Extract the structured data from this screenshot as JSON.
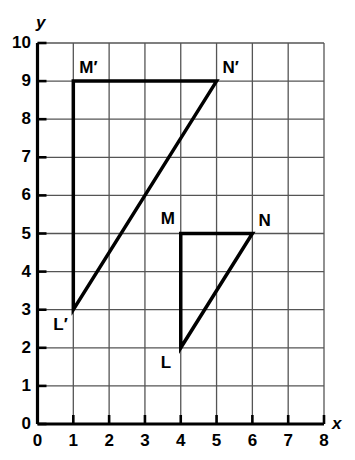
{
  "chart_data": {
    "type": "scatter",
    "title": "",
    "xlabel": "x",
    "ylabel": "y",
    "xlim": [
      0,
      8
    ],
    "ylim": [
      0,
      10
    ],
    "xticks": [
      "0",
      "1",
      "2",
      "3",
      "4",
      "5",
      "6",
      "7",
      "8"
    ],
    "yticks": [
      "0",
      "1",
      "2",
      "3",
      "4",
      "5",
      "6",
      "7",
      "8",
      "9",
      "10"
    ],
    "grid": true,
    "legend": "none",
    "shapes": [
      {
        "name": "triangle-LMN",
        "kind": "triangle",
        "vertices": [
          {
            "label": "L",
            "x": 4,
            "y": 2
          },
          {
            "label": "M",
            "x": 4,
            "y": 5
          },
          {
            "label": "N",
            "x": 6,
            "y": 5
          }
        ],
        "stroke": "#000000",
        "stroke_width": 3.5,
        "fill": "none"
      },
      {
        "name": "triangle-L-prime-M-prime-N-prime",
        "kind": "triangle",
        "vertices": [
          {
            "label": "L′",
            "x": 1,
            "y": 3
          },
          {
            "label": "M′",
            "x": 1,
            "y": 9
          },
          {
            "label": "N′",
            "x": 5,
            "y": 9
          }
        ],
        "stroke": "#000000",
        "stroke_width": 3.5,
        "fill": "none"
      }
    ],
    "point_labels": [
      {
        "text": "M′",
        "x": 1,
        "y": 9,
        "anchor": "above-right"
      },
      {
        "text": "N′",
        "x": 5,
        "y": 9,
        "anchor": "above-right"
      },
      {
        "text": "L′",
        "x": 1,
        "y": 3,
        "anchor": "below-left"
      },
      {
        "text": "M",
        "x": 4,
        "y": 5,
        "anchor": "above-left"
      },
      {
        "text": "N",
        "x": 6,
        "y": 5,
        "anchor": "above-right"
      },
      {
        "text": "L",
        "x": 4,
        "y": 2,
        "anchor": "below-left"
      }
    ],
    "colors": {
      "grid": "#555555",
      "axis": "#000000",
      "shape_stroke": "#000000",
      "background": "#ffffff"
    }
  },
  "axes": {
    "x_axis_label": "x",
    "y_axis_label": "y"
  }
}
